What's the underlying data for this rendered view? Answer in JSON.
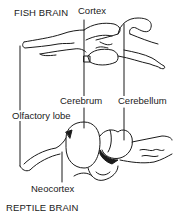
{
  "diagram": {
    "titles": {
      "fish": "FISH BRAIN",
      "reptile": "REPTILE BRAIN"
    },
    "labels": {
      "cortex": "Cortex",
      "cerebrum": "Cerebrum",
      "cerebellum": "Cerebellum",
      "olfactory_lobe": "Olfactory lobe",
      "neocortex": "Neocortex"
    },
    "colors": {
      "ink": "#1a1a1a",
      "background": "#ffffff"
    }
  }
}
